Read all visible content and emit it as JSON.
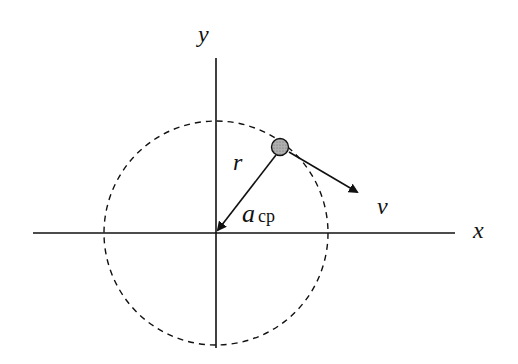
{
  "diagram": {
    "type": "uniform-circular-motion",
    "labels": {
      "y_axis": "y",
      "x_axis": "x",
      "radius": "r",
      "acceleration": "a",
      "acceleration_subscript": "cp",
      "velocity": "v"
    },
    "colors": {
      "stroke": "#111111",
      "particle_fill": "#a8a8a8",
      "background": "#ffffff"
    },
    "elements": [
      "x-axis",
      "y-axis",
      "dashed-circular-path",
      "particle",
      "radius-vector",
      "centripetal-acceleration-arrow",
      "velocity-arrow"
    ]
  }
}
